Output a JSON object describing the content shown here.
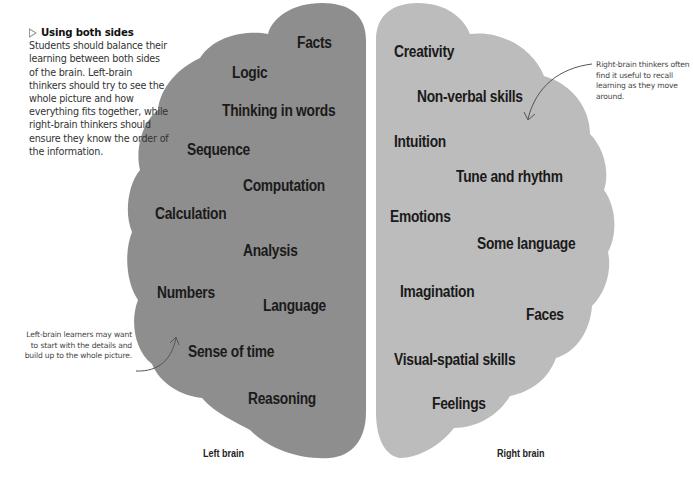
{
  "intro": {
    "icon": "triangle-right-icon",
    "title": "Using both sides",
    "body": "Students should balance their learning between both sides of the brain. Left-brain thinkers should try to see the whole picture and how everything fits together, while right-brain thinkers should ensure they know the order of the information."
  },
  "annotations": {
    "left": "Left-brain learners may want to start with the details and build up to the whole picture.",
    "right": "Right-brain thinkers often find it useful to recall learning as they move around."
  },
  "colors": {
    "left_hemisphere": "#8e8e8e",
    "right_hemisphere": "#bcbcbc",
    "arrow": "#555555"
  },
  "left_brain": {
    "label": "Left brain",
    "terms": [
      "Facts",
      "Logic",
      "Thinking in words",
      "Sequence",
      "Computation",
      "Calculation",
      "Analysis",
      "Numbers",
      "Language",
      "Sense of time",
      "Reasoning"
    ]
  },
  "right_brain": {
    "label": "Right brain",
    "terms": [
      "Creativity",
      "Non-verbal skills",
      "Intuition",
      "Tune and rhythm",
      "Emotions",
      "Some language",
      "Imagination",
      "Faces",
      "Visual-spatial skills",
      "Feelings"
    ]
  }
}
